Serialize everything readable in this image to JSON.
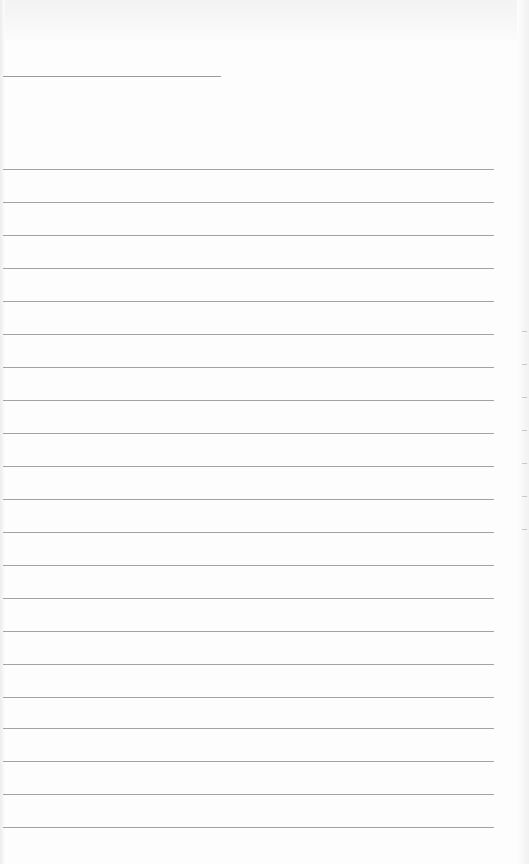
{
  "page": {
    "type": "lined-paper",
    "header_line": {
      "y": 76,
      "x1": 3,
      "x2": 221
    },
    "rules": [
      169,
      202,
      235,
      268,
      301,
      334,
      367,
      400,
      433,
      466,
      499,
      532,
      565,
      598,
      631,
      664,
      697,
      728,
      761,
      794,
      827
    ],
    "edge_ticks": [
      331,
      364,
      397,
      430,
      463,
      496,
      529
    ],
    "colors": {
      "paper": "#fdfdfd",
      "rule": "#a3a3a3"
    }
  }
}
